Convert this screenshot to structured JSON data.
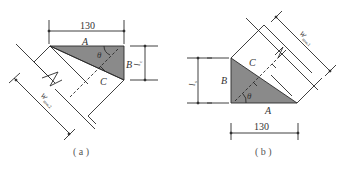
{
  "figures": [
    {
      "id": "a",
      "caption": "( a )",
      "dimension_top": "130",
      "label_A": "A",
      "label_B": "B",
      "label_C": "C",
      "angle": "θ",
      "vertical_dim": "l",
      "vertical_dim_sub": "c",
      "width_label": "W",
      "width_label_sub": "mw,2"
    },
    {
      "id": "b",
      "caption": "( b )",
      "dimension_bottom": "130",
      "label_A": "A",
      "label_B": "B",
      "label_C": "C",
      "angle": "θ",
      "vertical_dim": "l",
      "vertical_dim_sub": "s",
      "width_label": "W",
      "width_label_sub": "mw,1"
    }
  ],
  "colors": {
    "line": "#2a2a2a",
    "fill_triangle": "#8a8a8a",
    "text": "#333333"
  }
}
